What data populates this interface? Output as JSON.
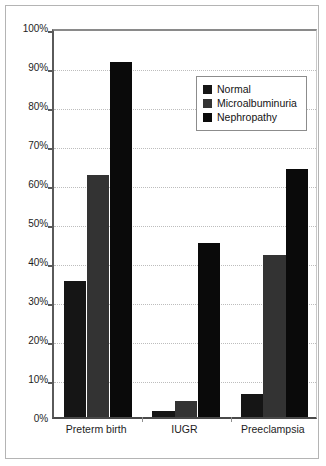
{
  "chart_data": {
    "type": "bar",
    "title": "",
    "subtitle": "",
    "xlabel": "",
    "ylabel": "",
    "categories": [
      "Preterm birth",
      "IUGR",
      "Preeclampsia"
    ],
    "series": [
      {
        "name": "Normal",
        "color": "#151515",
        "values": [
          35.0,
          1.5,
          6.0
        ]
      },
      {
        "name": "Microalbuminuria",
        "color": "#333333",
        "values": [
          62.0,
          4.0,
          41.5
        ]
      },
      {
        "name": "Nephropathy",
        "color": "#0a0a0a",
        "values": [
          91.0,
          44.5,
          63.5
        ]
      }
    ],
    "ylim": [
      0,
      100
    ],
    "ytick_values": [
      0,
      10,
      20,
      30,
      40,
      50,
      60,
      70,
      80,
      90,
      100
    ],
    "ytick_labels": [
      "0%",
      "10%",
      "20%",
      "30%",
      "40%",
      "50%",
      "60%",
      "70%",
      "80%",
      "90%",
      "100%"
    ],
    "grid": true,
    "grid_axis": "y",
    "legend_position": "top-right",
    "legend_entries": [
      "Normal",
      "Microalbuminuria",
      "Nephropathy"
    ],
    "annotations": []
  },
  "colors": {
    "background": "#ffffff",
    "frame_border": "#b4b4b4",
    "axis_line": "#5a5a5a",
    "gridline": "#bdbdbd",
    "text": "#1d1d1d"
  }
}
